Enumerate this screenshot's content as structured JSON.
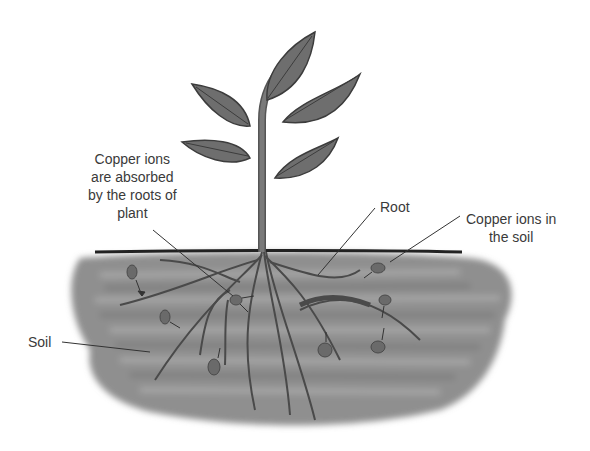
{
  "diagram": {
    "labels": {
      "absorbed": [
        "Copper ions",
        "are absorbed",
        "by the roots of",
        "plant"
      ],
      "root": "Root",
      "ions_in_soil": [
        "Copper ions in",
        "the soil"
      ],
      "soil": "Soil"
    },
    "colors": {
      "plant": "#6e6e6e",
      "plant_outline": "#3c3c3c",
      "soil": "#8a8a8a",
      "ion": "#6a6a6a",
      "text": "#3a3a3a",
      "ground_line": "#222222"
    }
  }
}
